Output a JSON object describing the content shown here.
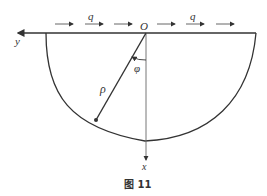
{
  "figure": {
    "caption": "图 11",
    "labels": {
      "origin": "O",
      "y_axis": "y",
      "x_axis": "x",
      "load_left": "q",
      "load_right": "q",
      "radius": "ρ",
      "angle": "φ"
    },
    "colors": {
      "stroke": "#333333",
      "axis": "#555555",
      "background": "#ffffff"
    }
  }
}
